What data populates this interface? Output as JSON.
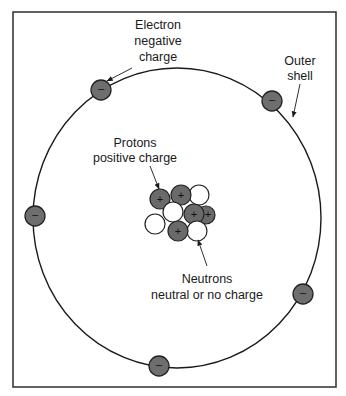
{
  "diagram": {
    "type": "atom-structure",
    "colors": {
      "frame": "#3a3a3a",
      "orbit": "#1a1a1a",
      "electron_fill": "#6e6e6e",
      "proton_fill": "#6a6a6a",
      "neutron_fill": "#ffffff",
      "outline": "#222222"
    },
    "labels": {
      "electron": {
        "line1": "Electron",
        "line2": "negative",
        "line3": "charge"
      },
      "outer_shell": {
        "line1": "Outer",
        "line2": "shell"
      },
      "protons": {
        "line1": "Protons",
        "line2": "positive charge"
      },
      "neutrons": {
        "line1": "Neutrons",
        "line2": "neutral or no charge"
      }
    },
    "symbols": {
      "electron_sign": "−",
      "proton_sign": "+"
    },
    "electron_count": 6,
    "nucleus": {
      "protons": 5,
      "neutrons": 4
    }
  }
}
